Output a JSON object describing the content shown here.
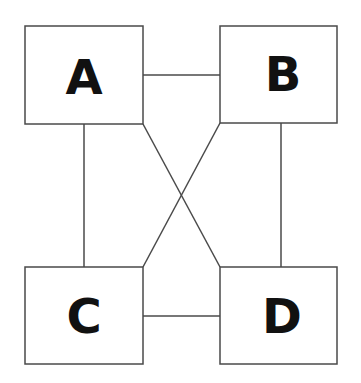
{
  "diagram": {
    "type": "graph",
    "nodes": [
      {
        "id": "A",
        "label": "A",
        "x": 25,
        "y": 26,
        "w": 118,
        "h": 98
      },
      {
        "id": "B",
        "label": "B",
        "x": 220,
        "y": 26,
        "w": 117,
        "h": 97
      },
      {
        "id": "C",
        "label": "C",
        "x": 25,
        "y": 267,
        "w": 118,
        "h": 97
      },
      {
        "id": "D",
        "label": "D",
        "x": 220,
        "y": 267,
        "w": 117,
        "h": 97
      }
    ],
    "edges": [
      {
        "from": "A",
        "to": "B"
      },
      {
        "from": "C",
        "to": "D"
      },
      {
        "from": "A",
        "to": "C"
      },
      {
        "from": "B",
        "to": "D"
      },
      {
        "from": "A",
        "to": "D"
      },
      {
        "from": "B",
        "to": "C"
      }
    ],
    "colors": {
      "stroke": "#4a4a4a",
      "text": "#111111",
      "background": "#ffffff"
    }
  }
}
